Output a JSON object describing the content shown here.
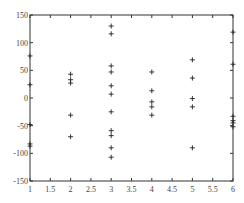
{
  "chart_data": {
    "type": "scatter",
    "title": "",
    "xlabel": "",
    "ylabel": "",
    "xlim": [
      1,
      6
    ],
    "ylim": [
      -150,
      150
    ],
    "grid": false,
    "legend": null,
    "marker": "+",
    "x_ticks": [
      "1",
      "1.5",
      "2",
      "2.5",
      "3",
      "3.5",
      "4",
      "4.5",
      "5",
      "5.5",
      "6"
    ],
    "y_ticks": [
      "-150",
      "-100",
      "-50",
      "0",
      "50",
      "100",
      "150"
    ],
    "series": [
      {
        "name": "data",
        "points": [
          {
            "x": 1,
            "y": 76
          },
          {
            "x": 1,
            "y": 24
          },
          {
            "x": 1,
            "y": -48
          },
          {
            "x": 1,
            "y": -83
          },
          {
            "x": 1,
            "y": -87
          },
          {
            "x": 2,
            "y": 43
          },
          {
            "x": 2,
            "y": 33
          },
          {
            "x": 2,
            "y": 27
          },
          {
            "x": 2,
            "y": -31
          },
          {
            "x": 2,
            "y": -70
          },
          {
            "x": 3,
            "y": 130
          },
          {
            "x": 3,
            "y": 116
          },
          {
            "x": 3,
            "y": 58
          },
          {
            "x": 3,
            "y": 47
          },
          {
            "x": 3,
            "y": 22
          },
          {
            "x": 3,
            "y": 7
          },
          {
            "x": 3,
            "y": -25
          },
          {
            "x": 3,
            "y": -59
          },
          {
            "x": 3,
            "y": -68
          },
          {
            "x": 3,
            "y": -90
          },
          {
            "x": 3,
            "y": -107
          },
          {
            "x": 4,
            "y": 47
          },
          {
            "x": 4,
            "y": 13
          },
          {
            "x": 4,
            "y": -7
          },
          {
            "x": 4,
            "y": -16
          },
          {
            "x": 4,
            "y": -31
          },
          {
            "x": 5,
            "y": 69
          },
          {
            "x": 5,
            "y": 36
          },
          {
            "x": 5,
            "y": -1
          },
          {
            "x": 5,
            "y": -16
          },
          {
            "x": 5,
            "y": -90
          },
          {
            "x": 6,
            "y": 119
          },
          {
            "x": 6,
            "y": 61
          },
          {
            "x": 6,
            "y": -33
          },
          {
            "x": 6,
            "y": -41
          },
          {
            "x": 6,
            "y": -45
          },
          {
            "x": 6,
            "y": -52
          }
        ]
      }
    ]
  },
  "colors": {
    "axis": "#333333",
    "marker": "#222222",
    "tick_label": "#444444",
    "background": "#ffffff"
  }
}
